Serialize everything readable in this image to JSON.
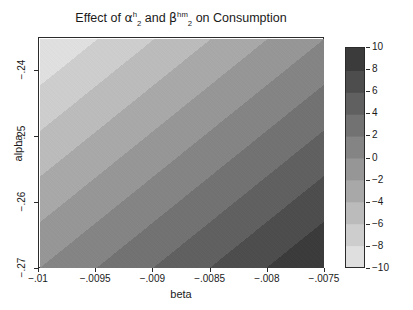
{
  "chart_data": {
    "type": "heatmap",
    "title_parts": {
      "prefix": "Effect of ",
      "var1_base": "α",
      "var1_sup": "h",
      "var1_sub": "2",
      "middle": " and ",
      "var2_base": "β",
      "var2_sup": "hm",
      "var2_sub": "2",
      "suffix": " on Consumption"
    },
    "xlabel": "beta",
    "ylabel": "alpha",
    "xticklabels": [
      "−.01",
      "−.0095",
      "−.009",
      "−.0085",
      "−.008",
      "−.0075"
    ],
    "xtickvalues": [
      -0.01,
      -0.0095,
      -0.009,
      -0.0085,
      -0.008,
      -0.0075
    ],
    "yticklabels": [
      "−.24",
      "−.25",
      "−.26",
      "−.27"
    ],
    "ytickvalues": [
      -0.24,
      -0.25,
      -0.26,
      -0.27
    ],
    "xlim": [
      -0.01,
      -0.0075
    ],
    "ylim": [
      -0.27,
      -0.235
    ],
    "grid": false,
    "colorbar": {
      "label": "Percent change from base case",
      "ticklabels": [
        "10",
        "8",
        "6",
        "4",
        "2",
        "0",
        "−2",
        "−4",
        "−6",
        "−8",
        "−10"
      ],
      "tickvalues": [
        10,
        8,
        6,
        4,
        2,
        0,
        -2,
        -4,
        -6,
        -8,
        -10
      ],
      "vmin": -10,
      "vmax": 10,
      "orientation": "vertical",
      "position": "right",
      "colormap": "gray-reversed-discrete",
      "n_levels": 10,
      "light_end_value": -10,
      "dark_end_value": 10
    },
    "colors": {
      "lightest": "#e8e8e8",
      "darkest": "#333333",
      "frame": "#2b2b2b",
      "text": "#1a1a1a",
      "background": "#ffffff"
    },
    "field_description": {
      "pattern": "diagonal-bands",
      "lightest_corner": "top-left",
      "darkest_corner": "bottom-right",
      "value_top_left": -10,
      "value_bottom_right": 10,
      "value_top_right": 0,
      "value_bottom_left": 0,
      "noise": true
    },
    "band_gray_levels": [
      "#e6e6e6",
      "#dadada",
      "#cccccc",
      "#bfbfbf",
      "#b2b2b2",
      "#a3a3a3",
      "#949494",
      "#858585",
      "#757575",
      "#666666",
      "#585858",
      "#4a4a4a",
      "#3d3d3d",
      "#343434"
    ]
  }
}
